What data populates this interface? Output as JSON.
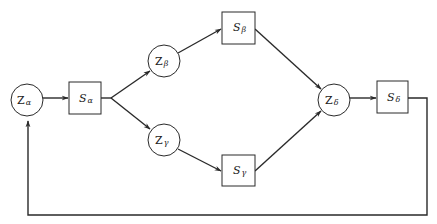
{
  "diagram": {
    "type": "flow-feedback-network",
    "nodes": [
      {
        "id": "Z_alpha",
        "shape": "circle",
        "main": "Z",
        "sub": "α"
      },
      {
        "id": "S_alpha",
        "shape": "box",
        "main": "S",
        "sub": "α"
      },
      {
        "id": "Z_beta",
        "shape": "circle",
        "main": "Z",
        "sub": "β"
      },
      {
        "id": "S_beta",
        "shape": "box",
        "main": "S",
        "sub": "β"
      },
      {
        "id": "Z_gamma",
        "shape": "circle",
        "main": "Z",
        "sub": "γ"
      },
      {
        "id": "S_gamma",
        "shape": "box",
        "main": "S",
        "sub": "γ"
      },
      {
        "id": "Z_delta",
        "shape": "circle",
        "main": "Z",
        "sub": "δ"
      },
      {
        "id": "S_delta",
        "shape": "box",
        "main": "S",
        "sub": "δ"
      }
    ],
    "edges": [
      {
        "from": "Z_alpha",
        "to": "S_alpha"
      },
      {
        "from": "S_alpha",
        "to": "Z_beta"
      },
      {
        "from": "S_alpha",
        "to": "Z_gamma"
      },
      {
        "from": "Z_beta",
        "to": "S_beta"
      },
      {
        "from": "Z_gamma",
        "to": "S_gamma"
      },
      {
        "from": "S_beta",
        "to": "Z_delta"
      },
      {
        "from": "S_gamma",
        "to": "Z_delta"
      },
      {
        "from": "Z_delta",
        "to": "S_delta"
      },
      {
        "from": "S_delta",
        "to": "Z_alpha",
        "kind": "feedback"
      }
    ]
  },
  "labels": {
    "z_alpha": {
      "main": "Z",
      "sub": "α"
    },
    "s_alpha": {
      "main": "S",
      "sub": "α"
    },
    "z_beta": {
      "main": "Z",
      "sub": "β"
    },
    "s_beta": {
      "main": "S",
      "sub": "β"
    },
    "z_gamma": {
      "main": "Z",
      "sub": "γ"
    },
    "s_gamma": {
      "main": "S",
      "sub": "γ"
    },
    "z_delta": {
      "main": "Z",
      "sub": "δ"
    },
    "s_delta": {
      "main": "S",
      "sub": "δ"
    }
  },
  "colors": {
    "stroke": "#2a2a2a",
    "background": "#ffffff",
    "text": "#222222"
  }
}
